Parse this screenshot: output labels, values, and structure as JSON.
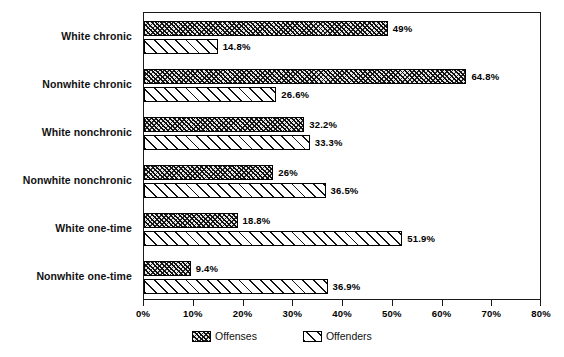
{
  "chart_data": {
    "type": "bar",
    "orientation": "horizontal",
    "title": "",
    "xlabel": "",
    "ylabel": "",
    "xlim": [
      0,
      80
    ],
    "xtick_labels": [
      "0%",
      "10%",
      "20%",
      "30%",
      "40%",
      "50%",
      "60%",
      "70%",
      "80%"
    ],
    "xtick_values": [
      0,
      10,
      20,
      30,
      40,
      50,
      60,
      70,
      80
    ],
    "grid": false,
    "legend_position": "bottom-center",
    "categories": [
      "White chronic",
      "Nonwhite chronic",
      "White nonchronic",
      "Nonwhite nonchronic",
      "White one-time",
      "Nonwhite one-time"
    ],
    "series": [
      {
        "name": "Offenses",
        "values": [
          49,
          64.8,
          32.2,
          26,
          18.8,
          9.4
        ],
        "labels": [
          "49%",
          "64.8%",
          "32.2%",
          "26%",
          "18.8%",
          "9.4%"
        ]
      },
      {
        "name": "Offenders",
        "values": [
          14.8,
          26.6,
          33.3,
          36.5,
          51.9,
          36.9
        ],
        "labels": [
          "14.8%",
          "26.6%",
          "33.3%",
          "36.5%",
          "51.9%",
          "36.9%"
        ]
      }
    ]
  },
  "legend": {
    "items": [
      {
        "label": "Offenses",
        "swatch": "dense-crosshatch-swatch"
      },
      {
        "label": "Offenders",
        "swatch": "diagonal-hatch-swatch"
      }
    ]
  }
}
